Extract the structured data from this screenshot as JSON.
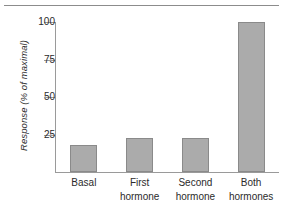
{
  "figure": {
    "top_rule": "horizontal-rule",
    "background_color": "#ffffff"
  },
  "chart_data": {
    "type": "bar",
    "title": "",
    "xlabel": "",
    "ylabel": "Response (% of maximal)",
    "categories": [
      "Basal",
      "First hormone",
      "Second hormone",
      "Both hormones"
    ],
    "category_lines": [
      [
        "Basal"
      ],
      [
        "First",
        "hormone"
      ],
      [
        "Second",
        "hormone"
      ],
      [
        "Both",
        "hormones"
      ]
    ],
    "values": [
      18,
      23,
      23,
      100
    ],
    "ylim": [
      0,
      100
    ],
    "yticks": [
      25,
      50,
      75,
      100
    ],
    "ytick_labels": [
      "25",
      "50",
      "75",
      "100"
    ],
    "grid": false,
    "legend": false,
    "bar_color": "#ababab",
    "bar_edge_color": "#8a8a8a",
    "axis_color": "#9a9a9a",
    "text_color": "#2b2b2b"
  }
}
